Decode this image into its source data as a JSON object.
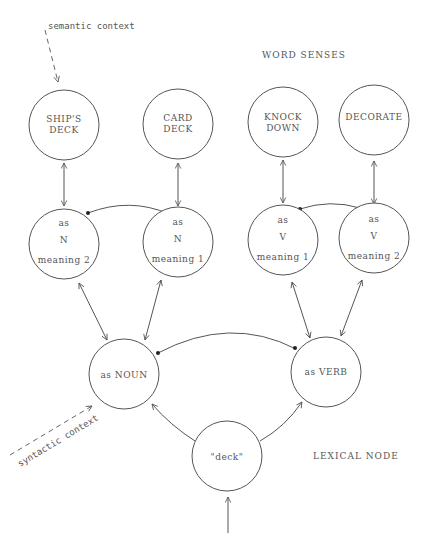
{
  "labels": {
    "word_senses": "WORD SENSES",
    "lexical_node": "LEXICAL NODE",
    "semantic_context": "semantic context",
    "syntactic_context": "syntactic context"
  },
  "nodes": {
    "ships_deck": {
      "line1": "SHIP'S",
      "line2": "DECK"
    },
    "card_deck": {
      "line1": "CARD",
      "line2": "DECK"
    },
    "knock_down": {
      "line1": "KNOCK",
      "line2": "DOWN"
    },
    "decorate": {
      "line1": "DECORATE"
    },
    "n_meaning2": {
      "line1": "as",
      "line2": "N",
      "line3": "meaning 2"
    },
    "n_meaning1": {
      "line1": "as",
      "line2": "N",
      "line3": "meaning 1"
    },
    "v_meaning1": {
      "line1": "as",
      "line2": "V",
      "line3": "meaning 1"
    },
    "v_meaning2": {
      "line1": "as",
      "line2": "V",
      "line3": "meaning 2"
    },
    "as_noun": {
      "line1": "as NOUN"
    },
    "as_verb": {
      "line1": "as VERB"
    },
    "lexical": {
      "line1": "\"deck\""
    }
  },
  "edges": [
    {
      "from": "ships_deck",
      "to": "n_meaning2",
      "type": "bidirectional"
    },
    {
      "from": "card_deck",
      "to": "n_meaning1",
      "type": "bidirectional"
    },
    {
      "from": "knock_down",
      "to": "v_meaning1",
      "type": "bidirectional"
    },
    {
      "from": "decorate",
      "to": "v_meaning2",
      "type": "bidirectional"
    },
    {
      "from": "n_meaning2",
      "to": "n_meaning1",
      "type": "inhibitory"
    },
    {
      "from": "v_meaning1",
      "to": "v_meaning2",
      "type": "inhibitory"
    },
    {
      "from": "n_meaning2",
      "to": "as_noun",
      "type": "bidirectional"
    },
    {
      "from": "n_meaning1",
      "to": "as_noun",
      "type": "bidirectional"
    },
    {
      "from": "v_meaning1",
      "to": "as_verb",
      "type": "bidirectional"
    },
    {
      "from": "v_meaning2",
      "to": "as_verb",
      "type": "bidirectional"
    },
    {
      "from": "as_noun",
      "to": "as_verb",
      "type": "inhibitory"
    },
    {
      "from": "lexical",
      "to": "as_noun",
      "type": "excitatory"
    },
    {
      "from": "lexical",
      "to": "as_verb",
      "type": "excitatory"
    },
    {
      "from": "input",
      "to": "lexical",
      "type": "excitatory"
    },
    {
      "from": "semantic_context",
      "to": "ships_deck",
      "type": "dashed"
    },
    {
      "from": "syntactic_context",
      "to": "as_noun",
      "type": "dashed"
    }
  ]
}
